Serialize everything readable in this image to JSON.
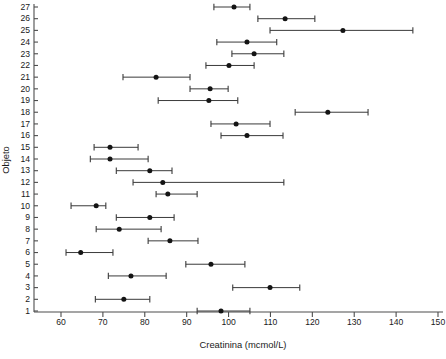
{
  "chart_data": {
    "type": "scatter",
    "title": "",
    "subtitle": "",
    "xlabel": "Creatinina (mcmol/L)",
    "ylabel": "Objeto",
    "orientation": "horizontal",
    "grid": false,
    "legend": null,
    "xlim": [
      52,
      150
    ],
    "ylim": [
      0.4,
      27.6
    ],
    "xticks": [
      60,
      70,
      80,
      90,
      100,
      110,
      120,
      130,
      140,
      150
    ],
    "xtick_labels": [
      "60",
      "70",
      "80",
      "90",
      "100",
      "110",
      "120",
      "130",
      "140",
      "150"
    ],
    "yticks": [
      1,
      2,
      3,
      4,
      5,
      6,
      7,
      8,
      9,
      10,
      11,
      12,
      13,
      14,
      15,
      16,
      17,
      18,
      19,
      20,
      21,
      22,
      23,
      24,
      25,
      26,
      27
    ],
    "ytick_labels": [
      "1",
      "2",
      "3",
      "4",
      "5",
      "6",
      "7",
      "8",
      "9",
      "10",
      "11",
      "12",
      "13",
      "14",
      "15",
      "16",
      "17",
      "18",
      "19",
      "20",
      "21",
      "22",
      "23",
      "24",
      "25",
      "26",
      "27"
    ],
    "marker": "filled-circle",
    "error_bar_style": "horizontal-interval-with-caps",
    "categories": [
      1,
      2,
      3,
      4,
      5,
      6,
      7,
      8,
      9,
      10,
      11,
      12,
      13,
      14,
      15,
      16,
      17,
      18,
      19,
      20,
      21,
      22,
      23,
      24,
      25,
      26,
      27
    ],
    "series": [
      {
        "name": "Creatinina estimate with interval",
        "points": [
          {
            "objeto": 1,
            "value": 98.2,
            "low": 92.5,
            "high": 105.1
          },
          {
            "objeto": 2,
            "value": 75.0,
            "low": 68.2,
            "high": 81.2
          },
          {
            "objeto": 3,
            "value": 109.9,
            "low": 101.0,
            "high": 117.0
          },
          {
            "objeto": 4,
            "value": 76.7,
            "low": 71.3,
            "high": 85.1
          },
          {
            "objeto": 5,
            "value": 95.8,
            "low": 89.8,
            "high": 103.9
          },
          {
            "objeto": 6,
            "value": 64.7,
            "low": 61.2,
            "high": 72.4
          },
          {
            "objeto": 7,
            "value": 86.0,
            "low": 80.8,
            "high": 92.7
          },
          {
            "objeto": 8,
            "value": 73.9,
            "low": 68.4,
            "high": 83.9
          },
          {
            "objeto": 9,
            "value": 81.2,
            "low": 73.2,
            "high": 87.0
          },
          {
            "objeto": 10,
            "value": 68.4,
            "low": 62.4,
            "high": 70.7
          },
          {
            "objeto": 11,
            "value": 85.5,
            "low": 82.7,
            "high": 92.5
          },
          {
            "objeto": 12,
            "value": 84.3,
            "low": 77.2,
            "high": 113.2
          },
          {
            "objeto": 13,
            "value": 81.2,
            "low": 73.2,
            "high": 86.5
          },
          {
            "objeto": 14,
            "value": 71.7,
            "low": 67.0,
            "high": 80.8
          },
          {
            "objeto": 15,
            "value": 71.7,
            "low": 67.9,
            "high": 78.4
          },
          {
            "objeto": 16,
            "value": 104.4,
            "low": 98.2,
            "high": 113.0
          },
          {
            "objeto": 17,
            "value": 101.8,
            "low": 95.8,
            "high": 109.9
          },
          {
            "objeto": 18,
            "value": 123.7,
            "low": 115.9,
            "high": 133.3
          },
          {
            "objeto": 19,
            "value": 95.3,
            "low": 83.2,
            "high": 102.2
          },
          {
            "objeto": 20,
            "value": 95.6,
            "low": 90.8,
            "high": 99.9
          },
          {
            "objeto": 21,
            "value": 82.7,
            "low": 74.8,
            "high": 90.8
          },
          {
            "objeto": 22,
            "value": 100.1,
            "low": 94.6,
            "high": 106.1
          },
          {
            "objeto": 23,
            "value": 106.1,
            "low": 100.8,
            "high": 113.2
          },
          {
            "objeto": 24,
            "value": 104.4,
            "low": 97.2,
            "high": 111.5
          },
          {
            "objeto": 25,
            "value": 127.3,
            "low": 109.9,
            "high": 144.0
          },
          {
            "objeto": 26,
            "value": 113.5,
            "low": 107.0,
            "high": 120.6
          },
          {
            "objeto": 27,
            "value": 101.3,
            "low": 96.5,
            "high": 105.1
          }
        ]
      }
    ],
    "colors": {
      "marker": "#141414",
      "interval": "#3a3a3a",
      "axis": "#4d4d4d",
      "background": "#ffffff",
      "text": "#1a1a1a"
    }
  }
}
